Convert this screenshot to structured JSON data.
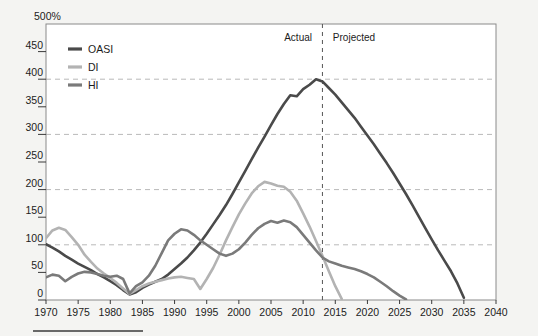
{
  "chart_data": {
    "type": "line",
    "title": "",
    "subtitle": "",
    "xlabel": "",
    "ylabel": "",
    "unit_label": "500%",
    "xlim": [
      1970,
      2040
    ],
    "ylim": [
      0,
      500
    ],
    "ytick_labels": [
      "0",
      "50",
      "100",
      "150",
      "200",
      "250",
      "300",
      "350",
      "400",
      "450"
    ],
    "ytick_values": [
      0,
      50,
      100,
      150,
      200,
      250,
      300,
      350,
      400,
      450
    ],
    "xtick_labels": [
      "1970",
      "1975",
      "1980",
      "1985",
      "1990",
      "1995",
      "2000",
      "2005",
      "2010",
      "2015",
      "2020",
      "2025",
      "2030",
      "2035",
      "2040"
    ],
    "xtick_values": [
      1970,
      1975,
      1980,
      1985,
      1990,
      1995,
      2000,
      2005,
      2010,
      2015,
      2020,
      2025,
      2030,
      2035,
      2040
    ],
    "gridlines_y": [
      100,
      200,
      300,
      400
    ],
    "grid": true,
    "legend_position": "top-left",
    "annotations": [
      {
        "name": "actual-label",
        "text": "Actual",
        "x": 2012,
        "y": 470,
        "align": "right"
      },
      {
        "name": "projected-label",
        "text": "Projected",
        "x": 2014,
        "y": 470,
        "align": "left"
      }
    ],
    "divider": {
      "name": "actual-projected-divider",
      "x": 2013,
      "style": "dashed"
    },
    "series": [
      {
        "name": "OASI",
        "color": "#4a4a4a",
        "x": [
          1970,
          1971,
          1972,
          1973,
          1974,
          1975,
          1976,
          1977,
          1978,
          1979,
          1980,
          1981,
          1982,
          1983,
          1984,
          1985,
          1986,
          1987,
          1988,
          1989,
          1990,
          1991,
          1992,
          1993,
          1994,
          1995,
          1996,
          1997,
          1998,
          1999,
          2000,
          2001,
          2002,
          2003,
          2004,
          2005,
          2006,
          2007,
          2008,
          2009,
          2010,
          2011,
          2012,
          2013,
          2014,
          2015,
          2016,
          2017,
          2018,
          2019,
          2020,
          2021,
          2022,
          2023,
          2024,
          2025,
          2026,
          2027,
          2028,
          2029,
          2030,
          2031,
          2032,
          2033,
          2034,
          2035
        ],
        "values": [
          101,
          95,
          88,
          80,
          73,
          66,
          60,
          54,
          47,
          41,
          34,
          27,
          18,
          10,
          14,
          22,
          28,
          33,
          38,
          46,
          56,
          66,
          77,
          90,
          104,
          120,
          137,
          154,
          172,
          192,
          213,
          234,
          255,
          276,
          296,
          317,
          337,
          355,
          371,
          369,
          382,
          390,
          400,
          396,
          384,
          372,
          358,
          344,
          330,
          314,
          298,
          282,
          265,
          248,
          230,
          211,
          192,
          172,
          151,
          130,
          110,
          90,
          71,
          52,
          30,
          4
        ]
      },
      {
        "name": "DI",
        "color": "#b3b3b3",
        "x": [
          1970,
          1971,
          1972,
          1973,
          1974,
          1975,
          1976,
          1977,
          1978,
          1979,
          1980,
          1981,
          1982,
          1983,
          1984,
          1985,
          1986,
          1987,
          1988,
          1989,
          1990,
          1991,
          1992,
          1993,
          1994,
          1995,
          1996,
          1997,
          1998,
          1999,
          2000,
          2001,
          2002,
          2003,
          2004,
          2005,
          2006,
          2007,
          2008,
          2009,
          2010,
          2011,
          2012,
          2013,
          2014,
          2015,
          2016
        ],
        "values": [
          112,
          126,
          131,
          127,
          114,
          100,
          82,
          69,
          57,
          48,
          40,
          31,
          21,
          11,
          18,
          25,
          30,
          33,
          36,
          39,
          41,
          42,
          40,
          38,
          20,
          38,
          58,
          82,
          108,
          132,
          155,
          175,
          193,
          206,
          214,
          211,
          207,
          205,
          196,
          180,
          157,
          133,
          107,
          80,
          52,
          25,
          2
        ]
      },
      {
        "name": "HI",
        "color": "#7a7a7a",
        "x": [
          1970,
          1971,
          1972,
          1973,
          1974,
          1975,
          1976,
          1977,
          1978,
          1979,
          1980,
          1981,
          1982,
          1983,
          1984,
          1985,
          1986,
          1987,
          1988,
          1989,
          1990,
          1991,
          1992,
          1993,
          1994,
          1995,
          1996,
          1997,
          1998,
          1999,
          2000,
          2001,
          2002,
          2003,
          2004,
          2005,
          2006,
          2007,
          2008,
          2009,
          2010,
          2011,
          2012,
          2013,
          2014,
          2015,
          2016,
          2017,
          2018,
          2019,
          2020,
          2021,
          2022,
          2023,
          2024,
          2025,
          2026
        ],
        "values": [
          41,
          46,
          44,
          34,
          42,
          48,
          51,
          50,
          47,
          44,
          42,
          44,
          38,
          12,
          25,
          32,
          44,
          62,
          85,
          108,
          120,
          128,
          126,
          118,
          108,
          100,
          92,
          84,
          80,
          84,
          92,
          104,
          118,
          130,
          138,
          143,
          140,
          144,
          141,
          132,
          118,
          104,
          90,
          77,
          70,
          66,
          62,
          59,
          56,
          52,
          47,
          41,
          33,
          25,
          16,
          8,
          1
        ]
      }
    ]
  },
  "legend": {
    "items": [
      {
        "label": "OASI",
        "color": "#4a4a4a"
      },
      {
        "label": "DI",
        "color": "#b3b3b3"
      },
      {
        "label": "HI",
        "color": "#7a7a7a"
      }
    ]
  },
  "colors": {
    "background": "#f4f4f2",
    "plot_background": "#ffffff",
    "axis": "#8a8a8a",
    "grid": "#b9b9b9",
    "text": "#1c1c1c",
    "oasi": "#4a4a4a",
    "di": "#b3b3b3",
    "hi": "#7a7a7a"
  },
  "footer_rule": {
    "name": "footer-rule",
    "visible": true
  }
}
